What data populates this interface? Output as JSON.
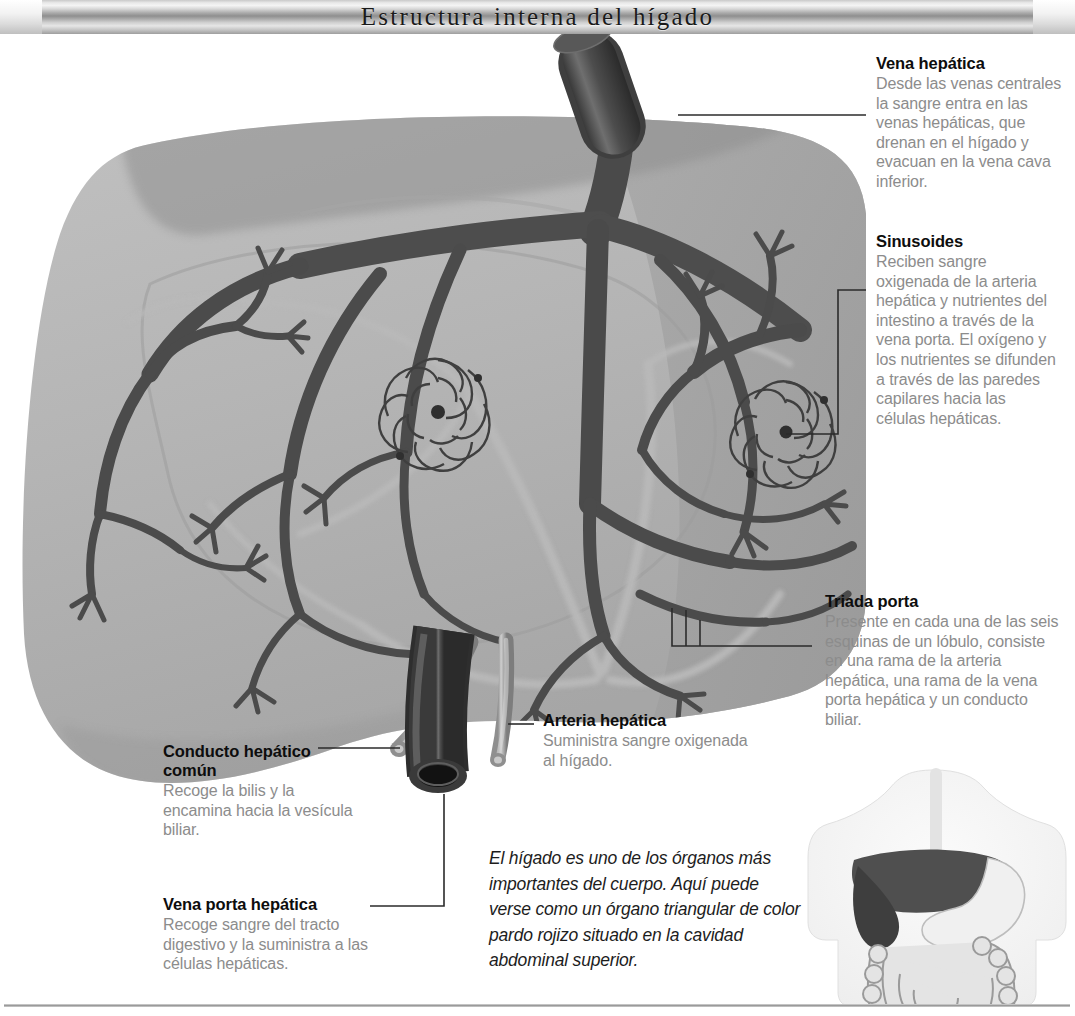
{
  "header": {
    "title": "Estructura interna del hígado"
  },
  "labels": [
    {
      "id": "vena-hepatica",
      "heading": "Vena hepática",
      "body": "Desde las venas centrales la sangre entra en las venas hepáticas, que drenan en el hígado y evacuan en la vena cava inferior."
    },
    {
      "id": "sinusoides",
      "heading": "Sinusoides",
      "body": "Reciben sangre oxigenada de la arteria hepática y nutrientes del intestino a través de la vena porta. El oxígeno y los nutrientes se difunden a través de las paredes capilares hacia las células hepáticas."
    },
    {
      "id": "triada-porta",
      "heading": "Triada porta",
      "body": "Presente en cada una de las seis esquinas de un lóbulo, consiste en una rama de la arteria hepática, una rama de la vena porta hepática y un conducto biliar."
    },
    {
      "id": "arteria-hepatica",
      "heading": "Arteria hepática",
      "body": "Suministra sangre oxigenada al hígado."
    },
    {
      "id": "conducto-hepatico-comun",
      "heading": "Conducto hepático común",
      "body": "Recoge la bilis y la encamina hacia la vesícula biliar."
    },
    {
      "id": "vena-porta-hepatica",
      "heading": "Vena porta hepática",
      "body": "Recoge sangre del tracto digestivo y la suministra a las células hepáticas."
    }
  ],
  "caption": {
    "text": "El hígado es uno de los órganos más importantes del cuerpo. Aquí puede verse como un órgano triangular de color pardo rojizo situado en la cavidad abdominal superior."
  },
  "colors": {
    "liver_body": "#b4b4b4",
    "liver_right_lobe": "#a3a3a3",
    "liver_shadow": "#8d8d8d",
    "vessel_dark": "#4b4b4b",
    "vessel_light": "#a9a9a9",
    "leader_line": "#2b2b2b",
    "heading_text": "#0d0d0d",
    "body_text": "#8c8c8c",
    "caption_text": "#1d1d1d",
    "background": "#ffffff"
  }
}
